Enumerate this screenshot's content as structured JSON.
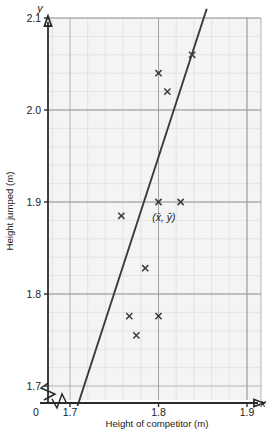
{
  "chart_data": {
    "type": "scatter",
    "title": "",
    "xlabel": "Height of competitor (m)",
    "ylabel": "Height jumped (m)",
    "x_axis_name": "x",
    "y_axis_name": "y",
    "origin_label": "0",
    "xlim": [
      1.7,
      1.9
    ],
    "ylim": [
      1.7,
      2.1
    ],
    "xticks": [
      "1.7",
      "1.8",
      "1.9"
    ],
    "xtick_values": [
      1.7,
      1.8,
      1.9
    ],
    "yticks": [
      "1.7",
      "1.8",
      "1.9",
      "2.0",
      "2.1"
    ],
    "ytick_values": [
      1.7,
      1.8,
      1.9,
      2.0,
      2.1
    ],
    "grid": true,
    "grid_minor_divisions": 5,
    "axis_break_x": true,
    "axis_break_y": true,
    "legend": "none",
    "marker": "x",
    "points": [
      {
        "x": 1.767,
        "y": 1.776
      },
      {
        "x": 1.775,
        "y": 1.755
      },
      {
        "x": 1.785,
        "y": 1.828
      },
      {
        "x": 1.8,
        "y": 1.776
      },
      {
        "x": 1.758,
        "y": 1.885
      },
      {
        "x": 1.8,
        "y": 1.9
      },
      {
        "x": 1.825,
        "y": 1.9
      },
      {
        "x": 1.8,
        "y": 2.04
      },
      {
        "x": 1.81,
        "y": 2.02
      },
      {
        "x": 1.838,
        "y": 2.06
      }
    ],
    "regression_line": {
      "label": "line of best fit",
      "x1": 1.7085,
      "y1": 1.6783,
      "x2": 1.8545,
      "y2": 2.11
    },
    "annotations": [
      {
        "name": "mean-point-label",
        "text": "(x̄, ȳ)",
        "x": 1.806,
        "y": 1.884
      }
    ],
    "colors": {
      "plot_background": "#f4f4f4",
      "grid_minor": "#d8d8d8",
      "grid_major": "#9a9a9a",
      "axis": "#2b2b2b",
      "line": "#3a3a3a",
      "marker": "#3b3b3b",
      "text": "#1b1b1b"
    }
  }
}
